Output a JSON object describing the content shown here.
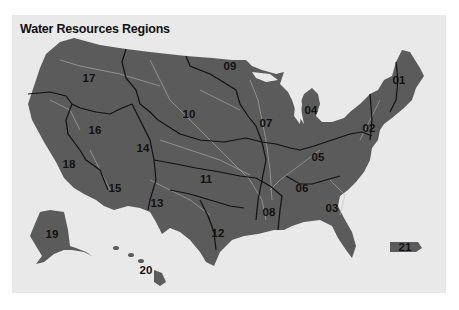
{
  "title": "Water Resources Regions",
  "colors": {
    "background": "#ffffff",
    "panel": "#e9e9e9",
    "land": "#5b5b5b",
    "rivers": "#b9b9b9",
    "borders": "#111111",
    "labels": "#111111"
  },
  "regions": [
    {
      "id": "01",
      "x": 399,
      "y": 80
    },
    {
      "id": "02",
      "x": 369,
      "y": 128
    },
    {
      "id": "03",
      "x": 332,
      "y": 208
    },
    {
      "id": "04",
      "x": 311,
      "y": 110
    },
    {
      "id": "05",
      "x": 318,
      "y": 157
    },
    {
      "id": "06",
      "x": 302,
      "y": 188
    },
    {
      "id": "07",
      "x": 266,
      "y": 123
    },
    {
      "id": "08",
      "x": 269,
      "y": 212
    },
    {
      "id": "09",
      "x": 230,
      "y": 66
    },
    {
      "id": "10",
      "x": 189,
      "y": 114
    },
    {
      "id": "11",
      "x": 206,
      "y": 179
    },
    {
      "id": "12",
      "x": 218,
      "y": 233
    },
    {
      "id": "13",
      "x": 157,
      "y": 203
    },
    {
      "id": "14",
      "x": 143,
      "y": 148
    },
    {
      "id": "15",
      "x": 115,
      "y": 188
    },
    {
      "id": "16",
      "x": 95,
      "y": 130
    },
    {
      "id": "17",
      "x": 89,
      "y": 78
    },
    {
      "id": "18",
      "x": 69,
      "y": 164
    },
    {
      "id": "19",
      "x": 52,
      "y": 234
    },
    {
      "id": "20",
      "x": 146,
      "y": 270
    },
    {
      "id": "21",
      "x": 405,
      "y": 247
    }
  ]
}
